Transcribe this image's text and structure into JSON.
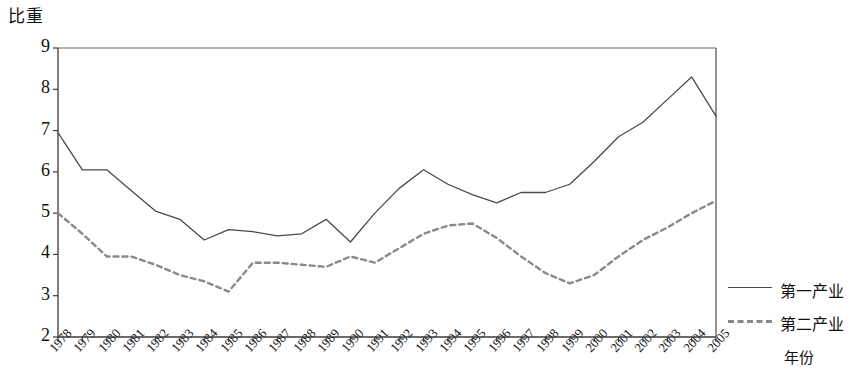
{
  "chart_data": {
    "type": "line",
    "title": "",
    "ylabel": "比重",
    "xlabel": "年份",
    "ylim": [
      2,
      9
    ],
    "y_ticks": [
      2,
      3,
      4,
      5,
      6,
      7,
      8,
      9
    ],
    "grid": false,
    "legend_position": "right",
    "categories": [
      "1978",
      "1979",
      "1980",
      "1981",
      "1982",
      "1983",
      "1984",
      "1985",
      "1986",
      "1987",
      "1988",
      "1989",
      "1990",
      "1991",
      "1992",
      "1993",
      "1994",
      "1995",
      "1996",
      "1997",
      "1998",
      "1999",
      "2000",
      "2001",
      "2002",
      "2003",
      "2004",
      "2005"
    ],
    "series": [
      {
        "name": "第一产业",
        "style": "solid",
        "color": "#4a4a4a",
        "values": [
          6.95,
          6.05,
          6.05,
          5.55,
          5.05,
          4.85,
          4.35,
          4.6,
          4.55,
          4.45,
          4.5,
          4.85,
          4.3,
          5.0,
          5.6,
          6.05,
          5.7,
          5.45,
          5.25,
          5.5,
          5.5,
          5.7,
          6.25,
          6.85,
          7.2,
          7.75,
          8.3,
          7.35
        ]
      },
      {
        "name": "第二产业",
        "style": "dashed",
        "color": "#8a8a8a",
        "values": [
          5.0,
          4.5,
          3.95,
          3.95,
          3.75,
          3.5,
          3.35,
          3.1,
          3.8,
          3.8,
          3.75,
          3.7,
          3.95,
          3.8,
          4.15,
          4.5,
          4.7,
          4.75,
          4.4,
          3.95,
          3.55,
          3.3,
          3.5,
          3.95,
          4.35,
          4.65,
          5.0,
          5.3
        ]
      }
    ],
    "series_end_notes": {
      "solid_2005": 7.1,
      "dashed_2004": 5.5,
      "dashed_2005": 4.6
    }
  },
  "legend": {
    "entries": [
      {
        "label": "第一产业",
        "style": "solid"
      },
      {
        "label": "第二产业",
        "style": "dashed"
      }
    ]
  }
}
